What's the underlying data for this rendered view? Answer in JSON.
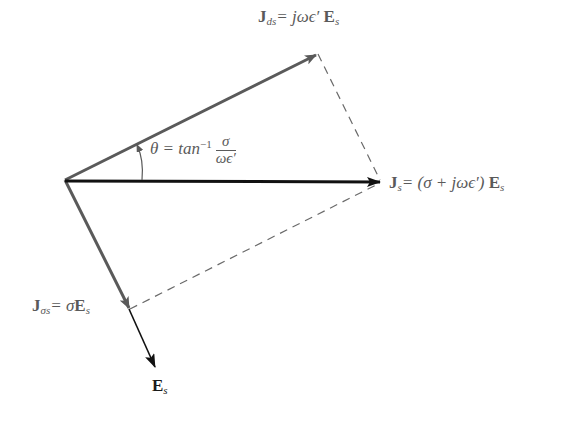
{
  "diagram": {
    "colors": {
      "conduction_displacement_arrows": "#5a5a5a",
      "total_and_field_arrows": "#111111",
      "dashed_lines": "#6a6a6a"
    },
    "labels": {
      "jds": {
        "symbol": "J",
        "sub": "ds",
        "rhs": "= jωϵ′ ",
        "field": "E",
        "field_sub": "s"
      },
      "js": {
        "symbol": "J",
        "sub": "s",
        "rhs": "= (σ + jωϵ′) ",
        "field": "E",
        "field_sub": "s"
      },
      "jsigma": {
        "symbol": "J",
        "sub": "σs",
        "rhs": "= σ",
        "field": "E",
        "field_sub": "s"
      },
      "es": {
        "symbol": "E",
        "sub": "s"
      },
      "theta": {
        "lhs": "θ = tan",
        "exp": "−1",
        "num": "σ",
        "den": "ωϵ′"
      }
    },
    "vectors": [
      {
        "name": "J_ds",
        "from": [
          65,
          180
        ],
        "to": [
          317,
          54
        ]
      },
      {
        "name": "J_s",
        "from": [
          65,
          180
        ],
        "to": [
          380,
          182
        ]
      },
      {
        "name": "J_sigma_s",
        "from": [
          65,
          180
        ],
        "to": [
          129,
          309
        ]
      },
      {
        "name": "E_s",
        "from": [
          129,
          309
        ],
        "to": [
          155,
          367
        ]
      }
    ]
  }
}
